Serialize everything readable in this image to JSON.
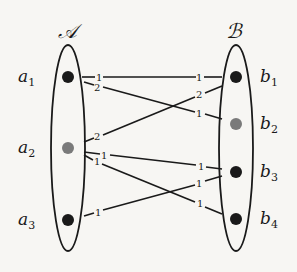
{
  "sets": {
    "A": {
      "label": "𝒜",
      "nodes": [
        {
          "id": "a1",
          "name": "a",
          "sub": "1",
          "color": "#1a1a1a"
        },
        {
          "id": "a2",
          "name": "a",
          "sub": "2",
          "color": "#7a7a7a"
        },
        {
          "id": "a3",
          "name": "a",
          "sub": "3",
          "color": "#1a1a1a"
        }
      ]
    },
    "B": {
      "label": "ℬ",
      "nodes": [
        {
          "id": "b1",
          "name": "b",
          "sub": "1",
          "color": "#1a1a1a"
        },
        {
          "id": "b2",
          "name": "b",
          "sub": "2",
          "color": "#7a7a7a"
        },
        {
          "id": "b3",
          "name": "b",
          "sub": "3",
          "color": "#1a1a1a"
        },
        {
          "id": "b4",
          "name": "b",
          "sub": "4",
          "color": "#1a1a1a"
        }
      ]
    }
  },
  "edges": [
    {
      "from": "a1",
      "to": "b1",
      "from_weight": "1",
      "to_weight": "1"
    },
    {
      "from": "a1",
      "to": "b2",
      "from_weight": "2",
      "to_weight": "1"
    },
    {
      "from": "a2",
      "to": "b1",
      "from_weight": "2",
      "to_weight": "2"
    },
    {
      "from": "a2",
      "to": "b3",
      "from_weight": "1",
      "to_weight": "1"
    },
    {
      "from": "a2",
      "to": "b4",
      "from_weight": "1",
      "to_weight": "1"
    },
    {
      "from": "a3",
      "to": "b3",
      "from_weight": "1",
      "to_weight": "1"
    }
  ]
}
